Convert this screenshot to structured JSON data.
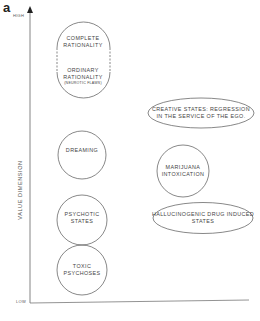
{
  "figure": {
    "panel_letter": "a",
    "y_axis": {
      "label": "VALUE DIMENSION",
      "high_label": "HIGH",
      "low_label": "LOW"
    },
    "nodes": [
      {
        "id": "complete-rationality",
        "lines": [
          "COMPLETE",
          "RATIONALITY"
        ],
        "shape": "capsule-dashed"
      },
      {
        "id": "ordinary-rationality",
        "lines": [
          "ORDINARY",
          "RATIONALITY"
        ],
        "note": "(NEUROTIC FLAWS)",
        "shape": "capsule-dashed"
      },
      {
        "id": "creative-states",
        "lines": [
          "CREATIVE STATES: REGRESSION",
          "IN THE SERVICE OF THE EGO."
        ],
        "shape": "ellipse"
      },
      {
        "id": "dreaming",
        "lines": [
          "DREAMING"
        ],
        "shape": "circle"
      },
      {
        "id": "marijuana",
        "lines": [
          "MARIJUANA",
          "INTOXICATION"
        ],
        "shape": "circle"
      },
      {
        "id": "psychotic",
        "lines": [
          "PSYCHOTIC",
          "STATES"
        ],
        "shape": "circle"
      },
      {
        "id": "hallucinogenic",
        "lines": [
          "HALLUCINOGENIC DRUG INDUCED",
          "STATES"
        ],
        "shape": "ellipse"
      },
      {
        "id": "toxic",
        "lines": [
          "TOXIC",
          "PSYCHOSES"
        ],
        "shape": "circle"
      }
    ],
    "colors": {
      "stroke": "#555555",
      "text": "#444444",
      "background": "#ffffff"
    }
  }
}
